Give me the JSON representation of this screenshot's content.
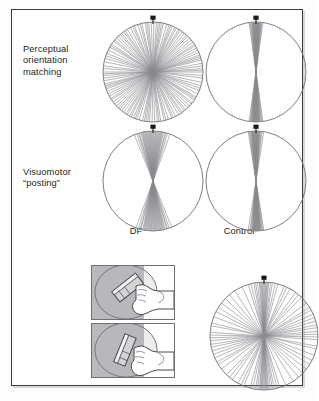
{
  "figure": {
    "row_labels": [
      {
        "id": "perceptual",
        "text": "Perceptual\norientation\nmatching"
      },
      {
        "id": "visuomotor",
        "text": "Visuomotor\n“posting”"
      }
    ],
    "column_labels": [
      {
        "id": "df",
        "text": "DF"
      },
      {
        "id": "control",
        "text": "Control"
      }
    ],
    "colors": {
      "frame": "#3c3c40",
      "circle_outline": "#6f6f74",
      "response_line": "#8a8a90",
      "marker": "#1a1a1a",
      "panel_background": "#b9b9bc",
      "text": "#231f20",
      "page": "#ffffff"
    },
    "marker": {
      "name": "target-orientation-marker",
      "angle_degrees": 0,
      "description": "black pin marker at top of circle indicating the target slot orientation"
    }
  },
  "chart_data": [
    {
      "id": "df-perceptual",
      "type": "scatter",
      "plot_style": "polar-orientation-rose",
      "title": "DF — Perceptual orientation matching",
      "radius": 50,
      "target_angle": 0,
      "units": "degrees",
      "angles": [
        -86,
        -78,
        -71,
        -64,
        -58,
        -52,
        -47,
        -41,
        -36,
        -31,
        -27,
        -22,
        -18,
        -13,
        -9,
        -5,
        -2,
        1,
        4,
        8,
        12,
        16,
        21,
        26,
        31,
        36,
        42,
        47,
        53,
        58,
        64,
        70,
        76,
        83,
        88,
        -90,
        -83,
        -60,
        -44,
        -24,
        6,
        19,
        33,
        50,
        67,
        80,
        -68,
        -50,
        -34,
        -15,
        10,
        28,
        44,
        61,
        74,
        86,
        -74,
        -56,
        -39,
        -7,
        23,
        39,
        56,
        72
      ],
      "notes": "responses distributed across the full orientation range; no clustering at target"
    },
    {
      "id": "control-perceptual",
      "type": "scatter",
      "plot_style": "polar-orientation-rose",
      "title": "Control — Perceptual orientation matching",
      "radius": 50,
      "target_angle": 0,
      "units": "degrees",
      "angles": [
        -7,
        -6,
        -5,
        -4.5,
        -4,
        -3.5,
        -3,
        -2.5,
        -2,
        -1.5,
        -1,
        -0.5,
        0,
        0.5,
        1,
        1.5,
        2,
        2.5,
        3,
        3.5,
        4,
        4.5,
        5,
        5.5,
        6,
        7,
        -8,
        8,
        -2.2,
        2.2,
        -3.3,
        3.3,
        0.8,
        -0.8,
        1.2
      ],
      "notes": "tight cluster about the vertical target orientation"
    },
    {
      "id": "df-visuomotor",
      "type": "scatter",
      "plot_style": "polar-orientation-rose",
      "title": "DF — Visuomotor “posting”",
      "radius": 50,
      "target_angle": 0,
      "units": "degrees",
      "angles": [
        -19,
        -16,
        -14,
        -12,
        -10,
        -9,
        -8,
        -7,
        -6,
        -5,
        -4,
        -3,
        -2,
        -1,
        0,
        1,
        2,
        3,
        4,
        5,
        6,
        7,
        8,
        10,
        12,
        14,
        17,
        -22,
        20,
        -11,
        9,
        -17,
        15,
        -13,
        11
      ],
      "notes": "clustered near vertical; hand orientation accurate despite failed perception"
    },
    {
      "id": "control-visuomotor",
      "type": "scatter",
      "plot_style": "polar-orientation-rose",
      "title": "Control — Visuomotor “posting”",
      "radius": 50,
      "target_angle": 0,
      "units": "degrees",
      "angles": [
        -8,
        -7,
        -6,
        -5.5,
        -5,
        -4.5,
        -4,
        -3.5,
        -3,
        -2.5,
        -2,
        -1.5,
        -1,
        -0.5,
        0,
        0.5,
        1,
        1.5,
        2,
        2.5,
        3,
        3.5,
        4,
        5,
        6,
        7,
        -9,
        9,
        -2.8,
        2.8,
        -4.2,
        4.2,
        1.1,
        -1.1,
        0.3
      ],
      "notes": "tight cluster about the vertical target orientation"
    },
    {
      "id": "bottom-right",
      "type": "scatter",
      "plot_style": "polar-orientation-rose",
      "title": "Orientation responses",
      "radius": 54,
      "target_angle": 0,
      "units": "degrees",
      "angles": [
        -14,
        -11,
        -9,
        -7,
        -5,
        -4,
        -3,
        -2,
        -1,
        0,
        1,
        2,
        3,
        4,
        5,
        7,
        9,
        12,
        -17,
        15,
        22,
        29,
        36,
        44,
        52,
        61,
        70,
        78,
        85,
        88,
        -24,
        -33,
        -46,
        -58,
        -69,
        -79,
        -86,
        -89,
        66,
        74,
        -63,
        -52,
        40,
        25,
        -40,
        58,
        -76,
        81
      ],
      "notes": "dense near-vertical cluster plus broadly scattered responses"
    }
  ],
  "illustrations": [
    {
      "id": "posting-task-top",
      "name": "posting-task-illustration-oblique",
      "description": "hand holding an oriented card toward a disk with a slot, card tilted obliquely"
    },
    {
      "id": "posting-task-bottom",
      "name": "posting-task-illustration-steep",
      "description": "hand holding an oriented card toward a disk with a slot, card rotated to a steeper angle"
    }
  ]
}
